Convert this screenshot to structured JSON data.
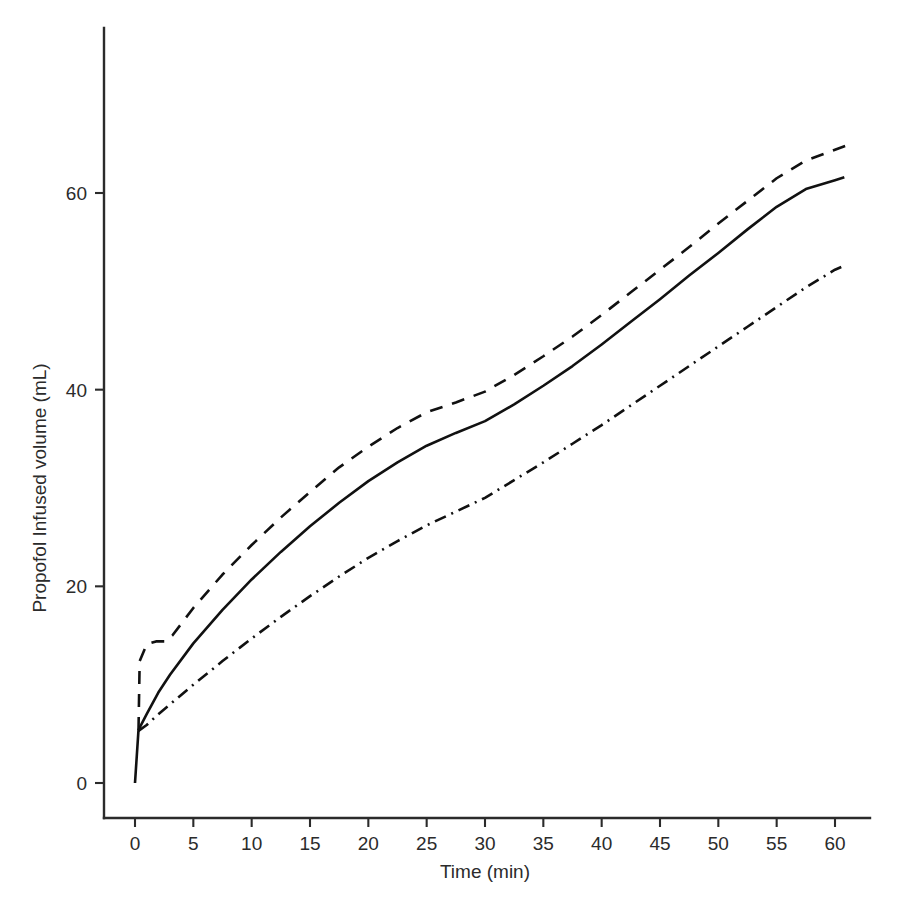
{
  "chart_data": {
    "type": "line",
    "title": "",
    "xlabel": "Time (min)",
    "ylabel": "Propofol Infused volume (mL)",
    "xlim": [
      -3,
      63
    ],
    "ylim": [
      -8,
      76
    ],
    "xticks": [
      0,
      5,
      10,
      15,
      20,
      25,
      30,
      35,
      40,
      45,
      50,
      55,
      60
    ],
    "xtick_labels": [
      "0",
      "5",
      "10",
      "15",
      "20",
      "25",
      "30",
      "35",
      "40",
      "45",
      "50",
      "55",
      "60"
    ],
    "yticks": [
      0,
      20,
      40,
      60
    ],
    "ytick_labels": [
      "0",
      "20",
      "40",
      "60"
    ],
    "grid": false,
    "legend": "none",
    "line_color": "#111111",
    "axis_color": "#2b2b2b",
    "background": "#ffffff",
    "series": [
      {
        "name": "solid",
        "style": "solid",
        "x": [
          0,
          0.3,
          1,
          2,
          3,
          5,
          7.5,
          10,
          12.5,
          15,
          17.5,
          20,
          22.5,
          25,
          27.5,
          30,
          32.5,
          35,
          37.5,
          40,
          42.5,
          45,
          47.5,
          50,
          52.5,
          55,
          57.5,
          60,
          60.8
        ],
        "y": [
          0,
          5.4,
          7.0,
          9.2,
          11.0,
          14.2,
          17.6,
          20.7,
          23.5,
          26.1,
          28.5,
          30.7,
          32.6,
          34.3,
          35.6,
          36.8,
          38.5,
          40.4,
          42.4,
          44.6,
          46.9,
          49.2,
          51.6,
          53.9,
          56.3,
          58.6,
          60.4,
          61.3,
          61.6
        ]
      },
      {
        "name": "dashed",
        "style": "dashed",
        "x": [
          0.3,
          0.4,
          1.0,
          1.8,
          2.6,
          3.2,
          5,
          7.5,
          10,
          12.5,
          15,
          17.5,
          20,
          22.5,
          25,
          27.5,
          30,
          32.5,
          35,
          37.5,
          40,
          42.5,
          45,
          47.5,
          50,
          52.5,
          55,
          57.5,
          60,
          60.9
        ],
        "y": [
          5.4,
          12.4,
          14.1,
          14.4,
          14.4,
          15.0,
          17.8,
          21.2,
          24.2,
          27.0,
          29.6,
          32.1,
          34.2,
          36.1,
          37.7,
          38.7,
          39.8,
          41.5,
          43.4,
          45.4,
          47.6,
          49.9,
          52.2,
          54.5,
          56.9,
          59.2,
          61.5,
          63.3,
          64.4,
          64.8
        ]
      },
      {
        "name": "dash-dot",
        "style": "dashdot",
        "x": [
          0.3,
          1,
          2,
          3,
          5,
          7.5,
          10,
          12.5,
          15,
          17.5,
          20,
          22.5,
          25,
          27.5,
          30,
          32.5,
          35,
          37.5,
          40,
          42.5,
          45,
          47.5,
          50,
          52.5,
          55,
          57.5,
          60,
          60.8
        ],
        "y": [
          5.3,
          5.9,
          7.0,
          8.0,
          10.0,
          12.4,
          14.7,
          16.9,
          19.0,
          21.0,
          22.9,
          24.6,
          26.2,
          27.6,
          29.0,
          30.8,
          32.6,
          34.5,
          36.4,
          38.4,
          40.4,
          42.4,
          44.4,
          46.4,
          48.4,
          50.4,
          52.2,
          52.6
        ]
      }
    ]
  }
}
